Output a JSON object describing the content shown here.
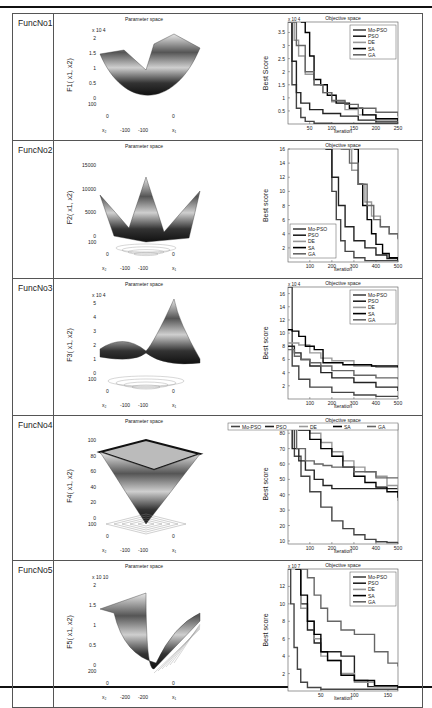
{
  "rows": [
    {
      "name": "FuncNo1",
      "surface_title": "Parameter space",
      "zlabel": "F1( x1, x2)",
      "ztick_exp": "x 10 4",
      "zticks": [
        "0",
        "0.5",
        "1",
        "1.5",
        "2"
      ],
      "xy_ticks": {
        "x2": [
          "100",
          "0",
          "-100"
        ],
        "x1": [
          "100",
          "0",
          "-100"
        ]
      },
      "shape": "bowl"
    },
    {
      "name": "FuncNo2",
      "surface_title": "Parameter space",
      "zlabel": "F2( x1, x2)",
      "ztick_exp": "",
      "zticks": [
        "0",
        "5000",
        "10000",
        "15000"
      ],
      "xy_ticks": {
        "x2": [
          "100",
          "0",
          "-100"
        ],
        "x1": [
          "100",
          "0",
          "-100"
        ]
      },
      "shape": "crown"
    },
    {
      "name": "FuncNo3",
      "surface_title": "Parameter space",
      "zlabel": "F3( x1, x2)",
      "ztick_exp": "x 10 4",
      "zticks": [
        "0",
        "1",
        "2",
        "3",
        "4",
        "5"
      ],
      "xy_ticks": {
        "x2": [
          "100",
          "0",
          "-100"
        ],
        "x1": [
          "100",
          "0",
          "-100"
        ]
      },
      "shape": "bowl2"
    },
    {
      "name": "FuncNo4",
      "surface_title": "Parameter space",
      "zlabel": "F4( x1, x2)",
      "ztick_exp": "",
      "zticks": [
        "0",
        "20",
        "40",
        "60",
        "80",
        "100"
      ],
      "xy_ticks": {
        "x2": [
          "100",
          "0",
          "-100"
        ],
        "x1": [
          "100",
          "0",
          "-100"
        ]
      },
      "shape": "pyramid"
    },
    {
      "name": "FuncNo5",
      "surface_title": "Parameter space",
      "zlabel": "F5( x1, x2)",
      "ztick_exp": "x 10 10",
      "zticks": [
        "0",
        "0.5",
        "1",
        "1.5",
        "2"
      ],
      "xy_ticks": {
        "x2": [
          "200",
          "0",
          "-200"
        ],
        "x1": [
          "200",
          "0",
          "-200"
        ]
      },
      "shape": "valley"
    }
  ],
  "chart_data": [
    {
      "type": "line",
      "title": "Objective space",
      "xlabel": "Iteration",
      "ylabel": "Best Score",
      "y_exp": "x 10 4",
      "xlim": [
        1,
        250
      ],
      "ylim": [
        0,
        3.9
      ],
      "xticks": [
        50,
        100,
        150,
        200,
        250
      ],
      "yticks": [
        0.5,
        1,
        1.5,
        2,
        2.5,
        3,
        3.5
      ],
      "legend": "top-right",
      "series": [
        {
          "name": "Mo-PSO",
          "color": "#444444",
          "x": [
            1,
            10,
            20,
            30,
            40,
            60,
            100,
            250
          ],
          "y": [
            3.9,
            1.5,
            0.6,
            0.25,
            0.1,
            0.03,
            0.02,
            0.01
          ]
        },
        {
          "name": "PSO",
          "color": "#222222",
          "x": [
            1,
            10,
            20,
            30,
            50,
            80,
            120,
            160,
            200,
            250
          ],
          "y": [
            3.9,
            2.4,
            1.2,
            0.8,
            0.55,
            0.4,
            0.3,
            0.15,
            0.08,
            0.05
          ]
        },
        {
          "name": "DE",
          "color": "#999999",
          "x": [
            1,
            15,
            25,
            40,
            60,
            80,
            100,
            130,
            160,
            200,
            250
          ],
          "y": [
            3.9,
            3.2,
            2.6,
            1.9,
            1.5,
            1.2,
            0.85,
            0.55,
            0.35,
            0.15,
            0.08
          ]
        },
        {
          "name": "SA",
          "color": "#000000",
          "x": [
            30,
            40,
            50,
            60,
            75,
            90,
            110,
            140,
            170,
            200,
            250
          ],
          "y": [
            3.9,
            3.5,
            2.6,
            1.7,
            1.5,
            1.1,
            0.8,
            0.6,
            0.35,
            0.2,
            0.1
          ]
        },
        {
          "name": "GA",
          "color": "#666666",
          "x": [
            1,
            20,
            40,
            60,
            80,
            100,
            130,
            160,
            200,
            250
          ],
          "y": [
            3.9,
            3.0,
            2.0,
            1.5,
            1.2,
            0.9,
            0.75,
            0.6,
            0.45,
            0.3
          ]
        }
      ]
    },
    {
      "type": "line",
      "title": "Objective space",
      "xlabel": "Iteration",
      "ylabel": "Best score",
      "y_exp": "",
      "xlim": [
        1,
        500
      ],
      "ylim": [
        0,
        16
      ],
      "xticks": [
        100,
        200,
        300,
        400,
        500
      ],
      "yticks": [
        2,
        4,
        6,
        8,
        10,
        12,
        14,
        16
      ],
      "legend": "bottom-left",
      "series": [
        {
          "name": "Mo-PSO",
          "color": "#444444",
          "x": [
            175,
            200,
            220,
            240,
            260,
            300,
            350,
            500
          ],
          "y": [
            16,
            10,
            6,
            3,
            1.5,
            0.6,
            0.2,
            0.1
          ]
        },
        {
          "name": "PSO",
          "color": "#222222",
          "x": [
            170,
            200,
            230,
            260,
            300,
            350,
            400,
            450,
            500
          ],
          "y": [
            16,
            12,
            8,
            5,
            3,
            2,
            1,
            0.5,
            0.3
          ]
        },
        {
          "name": "DE",
          "color": "#999999",
          "x": [
            250,
            290,
            320,
            350,
            380,
            420,
            460,
            500
          ],
          "y": [
            16,
            13,
            11,
            8.5,
            6.5,
            5,
            4,
            3.2
          ]
        },
        {
          "name": "SA",
          "color": "#000000",
          "x": [
            300,
            320,
            340,
            360,
            380,
            400,
            430,
            460,
            500
          ],
          "y": [
            16,
            11,
            8,
            6,
            4,
            2.5,
            1.2,
            0.6,
            0.3
          ]
        },
        {
          "name": "GA",
          "color": "#666666",
          "x": [
            240,
            280,
            320,
            360,
            390,
            420,
            460,
            500
          ],
          "y": [
            16,
            14,
            11,
            8,
            6,
            5,
            4,
            3.3
          ]
        }
      ]
    },
    {
      "type": "line",
      "title": "Objective space",
      "xlabel": "Iteration",
      "ylabel": "Best score",
      "y_exp": "x 10 4",
      "xlim": [
        1,
        500
      ],
      "ylim": [
        0,
        17
      ],
      "xticks": [
        100,
        200,
        300,
        400,
        500
      ],
      "yticks": [
        2,
        4,
        6,
        8,
        10,
        12,
        14,
        16
      ],
      "legend": "top-right",
      "series": [
        {
          "name": "Mo-PSO",
          "color": "#444444",
          "x": [
            1,
            20,
            50,
            100,
            200,
            300,
            400,
            500
          ],
          "y": [
            17,
            5,
            3,
            1.8,
            1,
            0.6,
            0.4,
            0.3
          ]
        },
        {
          "name": "PSO",
          "color": "#222222",
          "x": [
            1,
            30,
            60,
            100,
            150,
            200,
            300,
            400,
            500
          ],
          "y": [
            8,
            7,
            6,
            5,
            4,
            3.2,
            2.5,
            1.8,
            1.2
          ]
        },
        {
          "name": "DE",
          "color": "#999999",
          "x": [
            1,
            50,
            100,
            150,
            200,
            300,
            400,
            500
          ],
          "y": [
            8.5,
            8.2,
            7,
            6.2,
            5.8,
            5,
            4.8,
            4.7
          ]
        },
        {
          "name": "SA",
          "color": "#000000",
          "x": [
            1,
            20,
            50,
            80,
            120,
            160,
            250,
            380,
            500
          ],
          "y": [
            10.5,
            10.3,
            9.5,
            8,
            7.5,
            5.5,
            5.2,
            5,
            4.8
          ]
        },
        {
          "name": "GA",
          "color": "#666666",
          "x": [
            1,
            30,
            60,
            100,
            150,
            200,
            300,
            400,
            500
          ],
          "y": [
            7.5,
            6.5,
            6,
            5.5,
            5,
            4.3,
            3.6,
            3.2,
            3
          ]
        }
      ]
    },
    {
      "type": "line",
      "title": "Objective space",
      "xlabel": "Iteration",
      "ylabel": "Best score",
      "y_exp": "",
      "xlim": [
        1,
        500
      ],
      "ylim": [
        8,
        86
      ],
      "xticks": [
        100,
        200,
        300,
        400,
        500
      ],
      "yticks": [
        10,
        20,
        30,
        40,
        50,
        60,
        70,
        80
      ],
      "legend": "top",
      "series": [
        {
          "name": "Mo-PSO",
          "color": "#444444",
          "x": [
            1,
            30,
            60,
            100,
            150,
            200,
            250,
            300,
            350,
            400,
            450,
            500
          ],
          "y": [
            85,
            65,
            52,
            42,
            32,
            23,
            18,
            14,
            11,
            9.5,
            9,
            9
          ]
        },
        {
          "name": "PSO",
          "color": "#222222",
          "x": [
            1,
            20,
            50,
            80,
            120,
            160,
            200,
            300,
            400,
            500
          ],
          "y": [
            85,
            70,
            62,
            56,
            50,
            46,
            44,
            44,
            44,
            44
          ]
        },
        {
          "name": "DE",
          "color": "#999999",
          "x": [
            1,
            60,
            100,
            150,
            200,
            250,
            300,
            350,
            400,
            450,
            500
          ],
          "y": [
            85,
            83,
            80,
            74,
            68,
            62,
            58,
            55,
            52,
            46,
            36
          ]
        },
        {
          "name": "SA",
          "color": "#000000",
          "x": [
            1,
            50,
            100,
            150,
            200,
            250,
            300,
            350,
            400,
            450,
            500
          ],
          "y": [
            85,
            82,
            76,
            70,
            65,
            58,
            52,
            48,
            45,
            42,
            38
          ]
        },
        {
          "name": "GA",
          "color": "#666666",
          "x": [
            1,
            40,
            80,
            120,
            160,
            200,
            300,
            400,
            500
          ],
          "y": [
            85,
            70,
            62,
            60,
            59,
            58,
            55,
            51,
            51
          ]
        }
      ]
    },
    {
      "type": "line",
      "title": "Objective space",
      "xlabel": "Iteration",
      "ylabel": "Best score",
      "y_exp": "x 10 7",
      "xlim": [
        1,
        165
      ],
      "ylim": [
        0,
        14
      ],
      "xticks": [
        50,
        100,
        150
      ],
      "yticks": [
        2,
        4,
        6,
        8,
        10,
        12
      ],
      "legend": "top-right",
      "series": [
        {
          "name": "Mo-PSO",
          "color": "#444444",
          "x": [
            1,
            5,
            10,
            15,
            20,
            30,
            50,
            165
          ],
          "y": [
            14,
            10,
            5,
            2.5,
            1,
            0.4,
            0.2,
            0.1
          ]
        },
        {
          "name": "PSO",
          "color": "#222222",
          "x": [
            12,
            20,
            30,
            40,
            50,
            60,
            80,
            100,
            120,
            165
          ],
          "y": [
            14,
            10,
            7,
            5.5,
            4.5,
            4.5,
            4,
            1.2,
            0.5,
            0.3
          ]
        },
        {
          "name": "DE",
          "color": "#999999",
          "x": [
            12,
            20,
            30,
            40,
            50,
            60,
            80,
            100,
            130,
            165
          ],
          "y": [
            14,
            9.5,
            8,
            6,
            4,
            3.5,
            2,
            1,
            0.5,
            0.3
          ]
        },
        {
          "name": "SA",
          "color": "#000000",
          "x": [
            12,
            20,
            30,
            40,
            50,
            60,
            80,
            100,
            130,
            165
          ],
          "y": [
            14,
            11,
            8,
            6.5,
            4.5,
            3.5,
            1.8,
            1.2,
            0.6,
            0.3
          ]
        },
        {
          "name": "GA",
          "color": "#666666",
          "x": [
            20,
            30,
            40,
            50,
            60,
            80,
            100,
            130,
            150,
            165
          ],
          "y": [
            14,
            13,
            11,
            9.5,
            8,
            7,
            6.5,
            4.5,
            3.2,
            2.8
          ]
        }
      ]
    }
  ]
}
